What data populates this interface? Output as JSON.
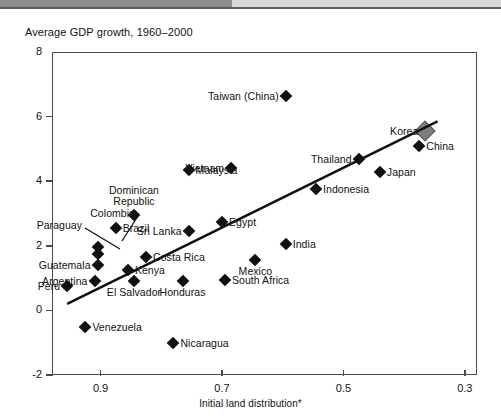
{
  "chart_data": {
    "type": "scatter",
    "title": "Average GDP growth, 1960–2000",
    "xlabel": "Initial land distribution*",
    "ylabel": "",
    "xlim": [
      0.98,
      0.28
    ],
    "ylim": [
      -2,
      8
    ],
    "x_reversed": true,
    "xticks": [
      "0.9",
      "0.7",
      "0.5",
      "0.3"
    ],
    "xtick_values": [
      0.9,
      0.7,
      0.5,
      0.3
    ],
    "yticks": [
      "8",
      "6",
      "4",
      "2",
      "0",
      "-2"
    ],
    "ytick_values": [
      8,
      6,
      4,
      2,
      0,
      -2
    ],
    "grid": false,
    "legend": false,
    "trendline": {
      "x1": 0.955,
      "y1": 0.2,
      "x2": 0.345,
      "y2": 5.85
    },
    "points": [
      {
        "name": "Taiwan (China)",
        "x": 0.595,
        "y": 6.65,
        "label_pos": "r",
        "marker": "small"
      },
      {
        "name": "Korea",
        "x": 0.365,
        "y": 5.55,
        "label_pos": "r",
        "marker": "large"
      },
      {
        "name": "China",
        "x": 0.375,
        "y": 5.1,
        "label_pos": "l",
        "marker": "small"
      },
      {
        "name": "Thailand",
        "x": 0.475,
        "y": 4.7,
        "label_pos": "r",
        "marker": "small"
      },
      {
        "name": "Japan",
        "x": 0.44,
        "y": 4.3,
        "label_pos": "l",
        "marker": "small"
      },
      {
        "name": "Vietnam",
        "x": 0.685,
        "y": 4.4,
        "label_pos": "r",
        "marker": "small"
      },
      {
        "name": "Malaysia",
        "x": 0.755,
        "y": 4.35,
        "label_pos": "l",
        "marker": "small"
      },
      {
        "name": "Indonesia",
        "x": 0.545,
        "y": 3.75,
        "label_pos": "l",
        "marker": "small"
      },
      {
        "name": "Dominican Republic",
        "x": 0.845,
        "y": 2.95,
        "label_pos": "c-above",
        "marker": "small"
      },
      {
        "name": "Egypt",
        "x": 0.7,
        "y": 2.75,
        "label_pos": "l",
        "marker": "small"
      },
      {
        "name": "Sri Lanka",
        "x": 0.755,
        "y": 2.45,
        "label_pos": "r",
        "marker": "small"
      },
      {
        "name": "Brazil",
        "x": 0.875,
        "y": 2.55,
        "label_pos": "l",
        "marker": "small"
      },
      {
        "name": "India",
        "x": 0.595,
        "y": 2.05,
        "label_pos": "l",
        "marker": "small"
      },
      {
        "name": "Colombia",
        "x": 0.905,
        "y": 1.95,
        "label_pos": "leader",
        "marker": "small"
      },
      {
        "name": "Paraguay",
        "x": 0.905,
        "y": 1.75,
        "label_pos": "leader",
        "marker": "small"
      },
      {
        "name": "Costa Rica",
        "x": 0.825,
        "y": 1.65,
        "label_pos": "l",
        "marker": "small"
      },
      {
        "name": "Mexico",
        "x": 0.645,
        "y": 1.55,
        "label_pos": "c-below",
        "marker": "small"
      },
      {
        "name": "Guatemala",
        "x": 0.905,
        "y": 1.4,
        "label_pos": "r",
        "marker": "small"
      },
      {
        "name": "Kenya",
        "x": 0.855,
        "y": 1.25,
        "label_pos": "l",
        "marker": "small"
      },
      {
        "name": "Argentina",
        "x": 0.91,
        "y": 0.9,
        "label_pos": "r",
        "marker": "small"
      },
      {
        "name": "South Africa",
        "x": 0.695,
        "y": 0.95,
        "label_pos": "l",
        "marker": "small"
      },
      {
        "name": "Honduras",
        "x": 0.765,
        "y": 0.9,
        "label_pos": "c-below",
        "marker": "small"
      },
      {
        "name": "El Salvador",
        "x": 0.845,
        "y": 0.9,
        "label_pos": "c-below",
        "marker": "small"
      },
      {
        "name": "Peru",
        "x": 0.955,
        "y": 0.75,
        "label_pos": "r",
        "marker": "small"
      },
      {
        "name": "Venezuela",
        "x": 0.925,
        "y": -0.5,
        "label_pos": "l",
        "marker": "small"
      },
      {
        "name": "Nicaragua",
        "x": 0.78,
        "y": -1.0,
        "label_pos": "l",
        "marker": "small"
      }
    ]
  }
}
